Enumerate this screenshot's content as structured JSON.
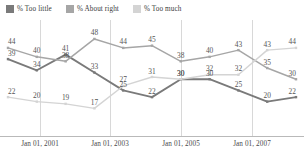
{
  "chart_data": {
    "type": "line",
    "title": "",
    "xlabel": "",
    "ylabel": "",
    "grid": true,
    "legend_position": "top-left",
    "ylim": [
      10,
      52
    ],
    "x": [
      "Jan 01, 2000",
      "Jan 01, 2001",
      "Jan 01, 2002",
      "Jan 01, 2003",
      "Jan 01, 2004",
      "Jan 01, 2005",
      "Jan 01, 2006",
      "Jan 01, 2007",
      "Jan 01, 2008",
      "Jan 01, 2009",
      "Jan 01, 2010"
    ],
    "tick_labels": [
      "Jan 01, 2001",
      "Jan 01, 2003",
      "Jan 01, 2005",
      "Jan 01, 2007"
    ],
    "series": [
      {
        "name": "% Too little",
        "color": "#7a7a7a",
        "values": [
          39,
          34,
          41,
          33,
          25,
          22,
          30,
          30,
          25,
          20,
          22
        ]
      },
      {
        "name": "% About right",
        "color": "#a6a6a6",
        "values": [
          44,
          40,
          38,
          48,
          44,
          45,
          38,
          40,
          43,
          35,
          30
        ]
      },
      {
        "name": "% Too much",
        "color": "#d4d4d4",
        "values": [
          22,
          20,
          19,
          17,
          27,
          31,
          30,
          32,
          32,
          43,
          44
        ]
      }
    ]
  },
  "legend": {
    "items": [
      {
        "label": "% Too little",
        "color": "#7a7a7a"
      },
      {
        "label": "% About right",
        "color": "#a6a6a6"
      },
      {
        "label": "% Too much",
        "color": "#d4d4d4"
      }
    ]
  },
  "axis": {
    "ticks": [
      {
        "label": "Jan 01, 2001",
        "x": 40
      },
      {
        "label": "Jan 01, 2003",
        "x": 110
      },
      {
        "label": "Jan 01, 2005",
        "x": 181
      },
      {
        "label": "Jan 01, 2007",
        "x": 252
      }
    ]
  }
}
